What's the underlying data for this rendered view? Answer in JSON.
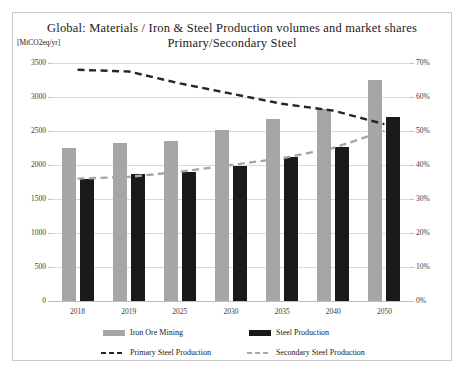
{
  "chart_data": {
    "type": "bar",
    "title": "Global: Materials / Iron & Steel  Production  volumes and market shares",
    "subtitle": "Primary/Secondary Steel",
    "unit_label": "[MtCO2eq/yr]",
    "xlabel": "",
    "ylabel": "",
    "categories": [
      "2018",
      "2019",
      "2025",
      "2030",
      "2035",
      "2040",
      "2050"
    ],
    "ylim": [
      0,
      3500
    ],
    "ylim_right": [
      0,
      70
    ],
    "yticks": [
      "0",
      "500",
      "1000",
      "1500",
      "2000",
      "2500",
      "3000",
      "3500"
    ],
    "yticks_right": [
      "0%",
      "10%",
      "20%",
      "30%",
      "40%",
      "50%",
      "60%",
      "70%"
    ],
    "grid": true,
    "legend_position": "bottom",
    "series": [
      {
        "name": "Iron Ore Mining",
        "type": "bar",
        "axis": "left",
        "color": "#a6a6a6",
        "values": [
          2250,
          2320,
          2360,
          2520,
          2670,
          2830,
          3250
        ]
      },
      {
        "name": "Steel Production",
        "type": "bar",
        "axis": "left",
        "color": "#1a1a1a",
        "values": [
          1800,
          1870,
          1890,
          1990,
          2120,
          2270,
          2700
        ]
      },
      {
        "name": "Primary Steel Production",
        "type": "line",
        "style": "dashed",
        "axis": "right",
        "color": "#262626",
        "values": [
          68,
          67.5,
          64,
          61,
          58,
          56,
          52
        ]
      },
      {
        "name": "Secondary Steel Production",
        "type": "line",
        "style": "dashed",
        "axis": "right",
        "color": "#a6a6a6",
        "values": [
          36,
          36.5,
          38,
          40,
          42,
          45,
          50
        ]
      }
    ]
  }
}
